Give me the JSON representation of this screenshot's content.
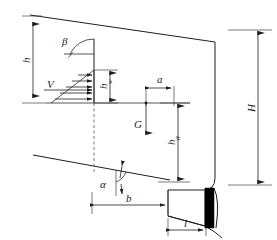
{
  "figure": {
    "type": "engineering-cross-section",
    "labels": {
      "beta": "β",
      "alpha": "α",
      "V": "V",
      "G": "G",
      "H": "H",
      "h": "h",
      "h_w": "h",
      "h_w_sub": "w",
      "h_0": "h",
      "h_0_sub": "0",
      "a": "a",
      "b": "b",
      "l": "l"
    },
    "annotations": [
      {
        "name": "beta-angle",
        "text": "β",
        "meaning": "upper-slope-inclination-angle"
      },
      {
        "name": "alpha-angle",
        "text": "α",
        "meaning": "basal-slip-plane-angle"
      },
      {
        "name": "water-thrust",
        "text": "V",
        "meaning": "hydrostatic-thrust-resultant"
      },
      {
        "name": "weight-force",
        "text": "G",
        "meaning": "block-weight-vertical"
      },
      {
        "name": "total-height",
        "text": "H",
        "meaning": "overall-block-height"
      },
      {
        "name": "crack-depth",
        "text": "h",
        "meaning": "tension-crack-depth"
      },
      {
        "name": "water-depth",
        "text": "hw",
        "meaning": "water-column-depth-in-crack"
      },
      {
        "name": "lever-arm-vertical",
        "text": "h0",
        "meaning": "vertical-lever-arm-to-base"
      },
      {
        "name": "offset-a",
        "text": "a",
        "meaning": "horizontal-offset-of-weight-line"
      },
      {
        "name": "base-width-b",
        "text": "b",
        "meaning": "base-width-dimension"
      },
      {
        "name": "toe-length-l",
        "text": "l",
        "meaning": "toe-slab-length"
      }
    ],
    "colors": {
      "line": "#1f1f1f",
      "dashed": "#555555",
      "fill_black": "#000000",
      "background": "#ffffff"
    }
  }
}
